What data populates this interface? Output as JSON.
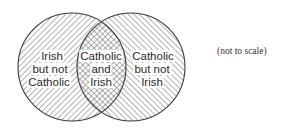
{
  "diagram": {
    "type": "venn",
    "sets": [
      {
        "name": "Irish",
        "hatch": "forward-diagonal",
        "center": [
          72,
          67
        ],
        "radius": 54
      },
      {
        "name": "Catholic",
        "hatch": "back-diagonal",
        "center": [
          131,
          67
        ],
        "radius": 54
      }
    ],
    "regions": [
      {
        "id": "irish-only",
        "lines": [
          "Irish",
          "but not",
          "Catholic"
        ]
      },
      {
        "id": "both",
        "lines": [
          "Catholic",
          "and",
          "Irish"
        ]
      },
      {
        "id": "catholic-only",
        "lines": [
          "Catholic",
          "but not",
          "Irish"
        ]
      }
    ],
    "note": "(not to scale)",
    "colors": {
      "stroke": "#3a3a3a",
      "hatch": "#555555",
      "background": "#ffffff"
    }
  }
}
